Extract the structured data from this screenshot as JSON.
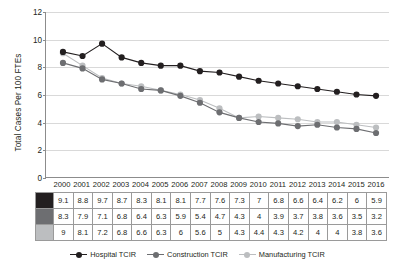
{
  "chart_data": {
    "type": "line",
    "title": "",
    "xlabel": "",
    "ylabel": "Total Cases Per 100 FTEs",
    "ylim": [
      0,
      12
    ],
    "ytick_step": 2,
    "yticks": [
      "0",
      "2",
      "4",
      "6",
      "8",
      "10",
      "12"
    ],
    "grid": true,
    "legend_position": "bottom",
    "categories": [
      "2000",
      "2001",
      "2002",
      "2003",
      "2004",
      "2005",
      "2006",
      "2007",
      "2008",
      "2009",
      "2010",
      "2011",
      "2012",
      "2013",
      "2014",
      "2015",
      "2016"
    ],
    "series": [
      {
        "name": "Hospital TCIR",
        "color": "#231f20",
        "values": [
          9.1,
          8.8,
          9.7,
          8.7,
          8.3,
          8.1,
          8.1,
          7.7,
          7.6,
          7.3,
          7,
          6.8,
          6.6,
          6.4,
          6.2,
          6,
          5.9
        ],
        "labels": [
          "9.1",
          "8.8",
          "9.7",
          "8.7",
          "8.3",
          "8.1",
          "8.1",
          "7.7",
          "7.6",
          "7.3",
          "7",
          "6.8",
          "6.6",
          "6.4",
          "6.2",
          "6",
          "5.9"
        ]
      },
      {
        "name": "Construction TCIR",
        "color": "#6d6e71",
        "values": [
          8.3,
          7.9,
          7.1,
          6.8,
          6.4,
          6.3,
          5.9,
          5.4,
          4.7,
          4.3,
          4,
          3.9,
          3.7,
          3.8,
          3.6,
          3.5,
          3.2
        ],
        "labels": [
          "8.3",
          "7.9",
          "7.1",
          "6.8",
          "6.4",
          "6.3",
          "5.9",
          "5.4",
          "4.7",
          "4.3",
          "4",
          "3.9",
          "3.7",
          "3.8",
          "3.6",
          "3.5",
          "3.2"
        ]
      },
      {
        "name": "Manufacturing TCIR",
        "color": "#bcbec0",
        "values": [
          9,
          8.1,
          7.2,
          6.8,
          6.6,
          6.3,
          6,
          5.6,
          5,
          4.3,
          4.4,
          4.3,
          4.2,
          4,
          4,
          3.8,
          3.6
        ],
        "labels": [
          "9",
          "8.1",
          "7.2",
          "6.8",
          "6.6",
          "6.3",
          "6",
          "5.6",
          "5",
          "4.3",
          "4.4",
          "4.3",
          "4.2",
          "4",
          "4",
          "3.8",
          "3.6"
        ]
      }
    ]
  },
  "legend": {
    "items": [
      {
        "label": "Hospital TCIR",
        "color": "#231f20"
      },
      {
        "label": "Construction TCIR",
        "color": "#6d6e71"
      },
      {
        "label": "Manufacturing TCIR",
        "color": "#bcbec0"
      }
    ]
  },
  "colors": {
    "hospital": "#231f20",
    "construction": "#6d6e71",
    "manufacturing": "#bcbec0",
    "grid": "#d9d9d9",
    "axis": "#8c8c8c",
    "table_border": "#9a9a9a"
  }
}
